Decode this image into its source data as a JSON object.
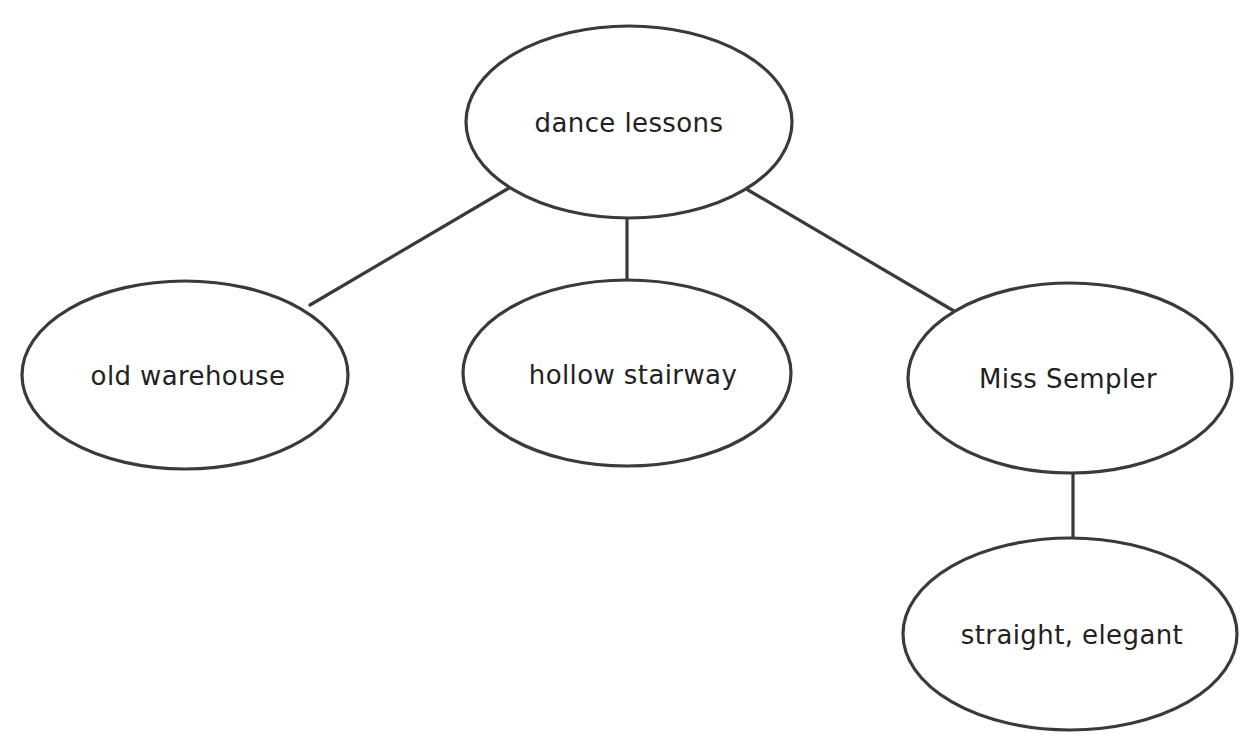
{
  "diagram": {
    "type": "concept-map",
    "background_color": "#ffffff",
    "stroke_color": "#3a3a3a",
    "text_color": "#222222",
    "nodes": [
      {
        "id": "root",
        "label": "dance lessons",
        "shape": "ellipse",
        "cx": 629,
        "cy": 122,
        "rx": 163,
        "ry": 96
      },
      {
        "id": "child-left",
        "label": "old warehouse",
        "shape": "ellipse",
        "cx": 185,
        "cy": 375,
        "rx": 163,
        "ry": 94
      },
      {
        "id": "child-middle",
        "label": "hollow stairway",
        "shape": "ellipse",
        "cx": 627,
        "cy": 373,
        "rx": 164,
        "ry": 93
      },
      {
        "id": "child-right",
        "label": "Miss Sempler",
        "shape": "ellipse",
        "cx": 1070,
        "cy": 378,
        "rx": 162,
        "ry": 95
      },
      {
        "id": "grandchild",
        "label": "straight, elegant",
        "shape": "ellipse",
        "cx": 1070,
        "cy": 634,
        "rx": 167,
        "ry": 96
      }
    ],
    "edges": [
      {
        "id": "edge-root-left",
        "from": "root",
        "to": "child-left",
        "from_label": "dance lessons",
        "to_label": "old warehouse",
        "x1": 509,
        "y1": 188,
        "x2": 310,
        "y2": 305
      },
      {
        "id": "edge-root-middle",
        "from": "root",
        "to": "child-middle",
        "from_label": "dance lessons",
        "to_label": "hollow stairway",
        "x1": 627,
        "y1": 217,
        "x2": 627,
        "y2": 281
      },
      {
        "id": "edge-root-right",
        "from": "root",
        "to": "child-right",
        "from_label": "dance lessons",
        "to_label": "Miss Sempler",
        "x1": 748,
        "y1": 190,
        "x2": 954,
        "y2": 311
      },
      {
        "id": "edge-right-grandchild",
        "from": "child-right",
        "to": "grandchild",
        "from_label": "Miss Sempler",
        "to_label": "straight, elegant",
        "x1": 1073,
        "y1": 473,
        "x2": 1073,
        "y2": 539
      }
    ]
  }
}
